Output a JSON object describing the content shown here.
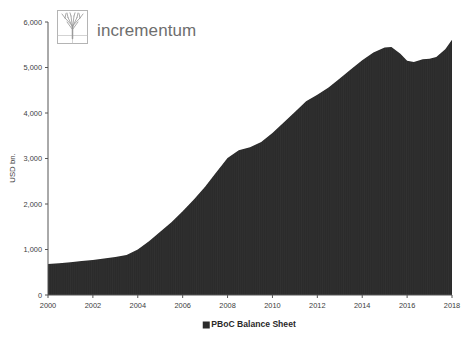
{
  "brand": {
    "wordmark": "incrementum",
    "logo_icon": "tree-in-frame-icon",
    "wordmark_color": "#6e6e6e"
  },
  "chart_data": {
    "type": "area",
    "title": "",
    "subtitle": "",
    "xlabel": "",
    "ylabel": "USD bn.",
    "xlim": [
      2000,
      2018
    ],
    "ylim": [
      0,
      6000
    ],
    "grid": false,
    "legend_position": "bottom-center",
    "series_color": "#2b2b2b",
    "x_tick_labels": [
      "2000",
      "2002",
      "2004",
      "2006",
      "2008",
      "2010",
      "2012",
      "2014",
      "2016",
      "2018"
    ],
    "x_ticks": [
      2000,
      2002,
      2004,
      2006,
      2008,
      2010,
      2012,
      2014,
      2016,
      2018
    ],
    "y_tick_labels": [
      "0",
      "1,000",
      "2,000",
      "3,000",
      "4,000",
      "5,000",
      "6,000"
    ],
    "y_ticks": [
      0,
      1000,
      2000,
      3000,
      4000,
      5000,
      6000
    ],
    "legend": [
      {
        "label": "PBoC Balance Sheet",
        "color": "#2b2b2b",
        "marker": "square"
      }
    ],
    "series": [
      {
        "name": "PBoC Balance Sheet",
        "color": "#2b2b2b",
        "x": [
          2000.0,
          2000.5,
          2001.0,
          2001.5,
          2002.0,
          2002.5,
          2003.0,
          2003.5,
          2004.0,
          2004.5,
          2005.0,
          2005.5,
          2006.0,
          2006.5,
          2007.0,
          2007.5,
          2008.0,
          2008.5,
          2009.0,
          2009.5,
          2010.0,
          2010.5,
          2011.0,
          2011.5,
          2012.0,
          2012.5,
          2013.0,
          2013.5,
          2014.0,
          2014.5,
          2015.0,
          2015.3,
          2015.7,
          2016.0,
          2016.3,
          2016.7,
          2017.0,
          2017.3,
          2017.7,
          2018.0
        ],
        "values": [
          680,
          700,
          720,
          745,
          770,
          800,
          835,
          880,
          1000,
          1180,
          1390,
          1600,
          1840,
          2100,
          2380,
          2700,
          3010,
          3180,
          3250,
          3360,
          3560,
          3790,
          4020,
          4260,
          4400,
          4560,
          4760,
          4960,
          5160,
          5330,
          5440,
          5450,
          5300,
          5150,
          5120,
          5180,
          5190,
          5230,
          5400,
          5610
        ]
      }
    ]
  }
}
